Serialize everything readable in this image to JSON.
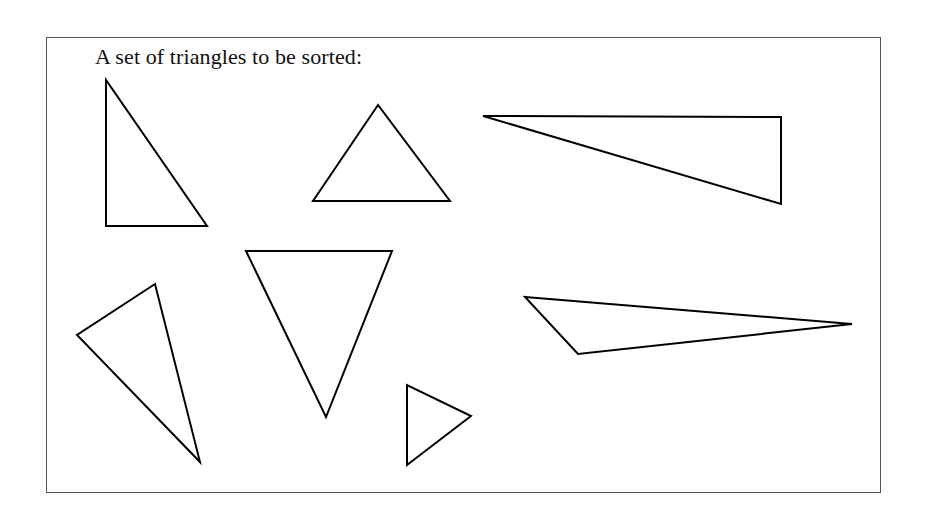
{
  "figure": {
    "caption": "A set of triangles to be sorted:",
    "stroke_color": "#000000",
    "frame_color": "#555555"
  },
  "triangles": [
    {
      "id": "right-tall",
      "type": "right",
      "points": "106,80 106,226 207,226"
    },
    {
      "id": "equilateral-ish",
      "type": "acute",
      "points": "378,105 313,201 450,201"
    },
    {
      "id": "right-long",
      "type": "right",
      "points": "483,116 781,117 781,204"
    },
    {
      "id": "scalene-tilted",
      "type": "scalene",
      "points": "155,284 77,335 200,462"
    },
    {
      "id": "inverted-isosceles",
      "type": "isosceles",
      "points": "246,251 392,251 326,417"
    },
    {
      "id": "small",
      "type": "acute",
      "points": "407,385 407,465 471,416"
    },
    {
      "id": "obtuse-long",
      "type": "obtuse",
      "points": "525,297 852,324 578,354"
    }
  ]
}
